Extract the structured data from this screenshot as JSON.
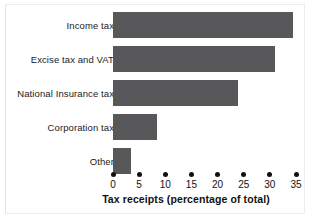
{
  "chart_data": {
    "type": "bar",
    "orientation": "horizontal",
    "title": "",
    "xlabel": "Tax receipts (percentage of total)",
    "ylabel": "",
    "categories": [
      "Income tax",
      "Excise tax and VAT",
      "National Insurance tax",
      "Corporation tax",
      "Other"
    ],
    "values": [
      34.5,
      31,
      24,
      8.5,
      3.5
    ],
    "xlim": [
      0,
      35
    ],
    "xticks": [
      0,
      5,
      10,
      15,
      20,
      25,
      30,
      35
    ],
    "xtick_labels": [
      "0",
      "5",
      "10",
      "15",
      "20",
      "25",
      "30",
      "35"
    ],
    "grid": false,
    "legend": false,
    "bar_color": "#58585a",
    "tick_marker": "dot",
    "axis_color": "#111111",
    "background": "#ffffff"
  },
  "axis": {
    "x_title": "Tax receipts (percentage of total)"
  }
}
